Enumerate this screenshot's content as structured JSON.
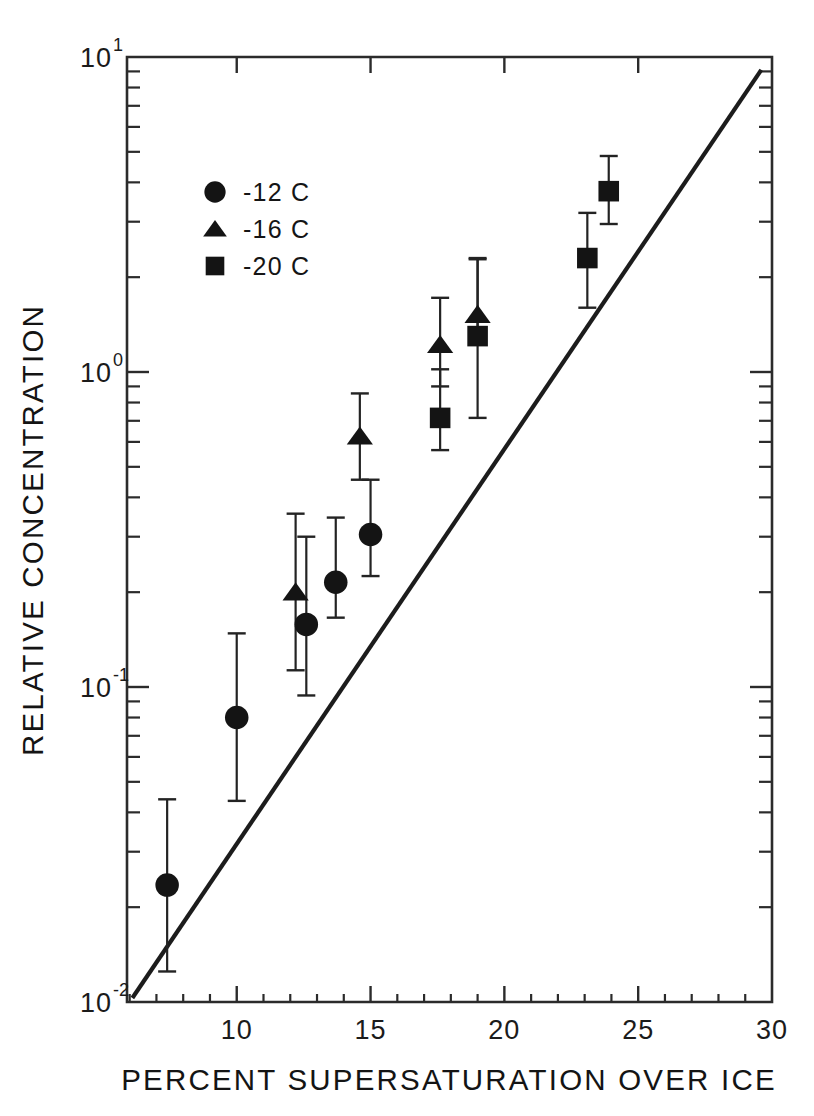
{
  "chart_data": {
    "type": "scatter",
    "title": "",
    "xlabel": "PERCENT SUPERSATURATION OVER ICE",
    "ylabel": "RELATIVE CONCENTRATION",
    "xscale": "linear",
    "yscale": "log",
    "xlim": [
      5.9,
      30.0
    ],
    "ylim": [
      0.01,
      10.0
    ],
    "grid": false,
    "legend_position": "upper-left-inside",
    "xticks": [
      10,
      15,
      20,
      25,
      30
    ],
    "xtick_labels": [
      "10",
      "15",
      "20",
      "25",
      "30"
    ],
    "yticks": [
      0.01,
      0.1,
      1,
      10
    ],
    "ytick_labels": [
      "10-2",
      "10-1",
      "100",
      "101"
    ],
    "ytick_mantissas": [
      "10",
      "10",
      "10",
      "10"
    ],
    "ytick_exponents": [
      "-2",
      "-1",
      "0",
      "1"
    ],
    "series": [
      {
        "name": "-12 C",
        "marker": "circle",
        "legend_label": "-12 C",
        "points": [
          {
            "x": 7.4,
            "y": 0.0235,
            "yerr_low": 0.0125,
            "yerr_high": 0.044
          },
          {
            "x": 10.0,
            "y": 0.08,
            "yerr_low": 0.0435,
            "yerr_high": 0.148
          },
          {
            "x": 12.6,
            "y": 0.158,
            "yerr_low": 0.094,
            "yerr_high": 0.3
          },
          {
            "x": 13.7,
            "y": 0.215,
            "yerr_low": 0.166,
            "yerr_high": 0.345
          },
          {
            "x": 15.0,
            "y": 0.305,
            "yerr_low": 0.225,
            "yerr_high": 0.455
          }
        ]
      },
      {
        "name": "-16 C",
        "marker": "triangle",
        "legend_label": "-16 C",
        "points": [
          {
            "x": 12.2,
            "y": 0.2,
            "yerr_low": 0.113,
            "yerr_high": 0.355
          },
          {
            "x": 14.6,
            "y": 0.625,
            "yerr_low": 0.455,
            "yerr_high": 0.855
          },
          {
            "x": 17.6,
            "y": 1.22,
            "yerr_low": 0.9,
            "yerr_high": 1.72
          },
          {
            "x": 19.0,
            "y": 1.52,
            "yerr_low": 1.24,
            "yerr_high": 2.3
          }
        ]
      },
      {
        "name": "-20 C",
        "marker": "square",
        "legend_label": "-20 C",
        "points": [
          {
            "x": 17.6,
            "y": 0.715,
            "yerr_low": 0.565,
            "yerr_high": 1.02
          },
          {
            "x": 19.0,
            "y": 1.3,
            "yerr_low": 0.715,
            "yerr_high": 2.28
          },
          {
            "x": 23.1,
            "y": 2.3,
            "yerr_low": 1.6,
            "yerr_high": 3.2
          },
          {
            "x": 23.9,
            "y": 3.75,
            "yerr_low": 2.95,
            "yerr_high": 4.85
          }
        ]
      }
    ],
    "fit_line": {
      "label": "",
      "x_start": 6.1,
      "y_start": 0.0103,
      "x_end": 29.6,
      "y_end": 9.1
    },
    "annotations": []
  },
  "legend": {
    "entries": [
      {
        "marker": "circle-marker",
        "label": "-12 C"
      },
      {
        "marker": "triangle-marker",
        "label": "-16 C"
      },
      {
        "marker": "square-marker",
        "label": "-20 C"
      }
    ]
  },
  "axes": {
    "x_title": "PERCENT SUPERSATURATION OVER ICE",
    "y_title": "RELATIVE CONCENTRATION"
  }
}
